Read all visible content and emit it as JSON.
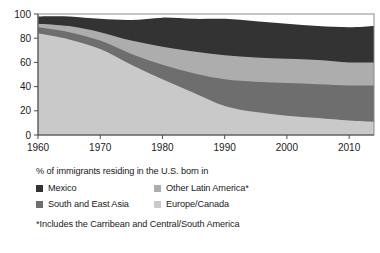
{
  "chart_data": {
    "type": "area",
    "stacked": true,
    "title": "",
    "subtitle": "",
    "xlabel": "",
    "ylabel": "",
    "xlim": [
      1960,
      2014
    ],
    "ylim": [
      0,
      100
    ],
    "grid": false,
    "legend_position": "below",
    "x_ticks": [
      "1960",
      "1970",
      "1980",
      "1990",
      "2000",
      "2010"
    ],
    "x_tick_values": [
      1960,
      1970,
      1980,
      1990,
      2000,
      2010
    ],
    "y_ticks": [
      "0",
      "20",
      "40",
      "60",
      "80",
      "100"
    ],
    "y_tick_values": [
      0,
      20,
      40,
      60,
      80,
      100
    ],
    "x": [
      1960,
      1965,
      1970,
      1975,
      1980,
      1985,
      1990,
      1995,
      2000,
      2005,
      2010,
      2014
    ],
    "series": [
      {
        "name": "Europe/Canada",
        "color": "#c9c9c9",
        "values": [
          84,
          79,
          71,
          58,
          46,
          35,
          24,
          19,
          16,
          14,
          12,
          11
        ]
      },
      {
        "name": "South and East Asia",
        "color": "#6e6e6e",
        "values": [
          5,
          6,
          7,
          9,
          12,
          16,
          22,
          25,
          27,
          28,
          29,
          30
        ]
      },
      {
        "name": "Other Latin America*",
        "color": "#adadad",
        "values": [
          3,
          5,
          7,
          11,
          15,
          18,
          20,
          20,
          20,
          20,
          19,
          19
        ]
      },
      {
        "name": "Mexico",
        "color": "#333333",
        "values": [
          6,
          8,
          11,
          17,
          24,
          27,
          30,
          30,
          29,
          28,
          29,
          30
        ]
      }
    ],
    "cumulative_tops": {
      "Europe/Canada": [
        84,
        79,
        71,
        58,
        46,
        35,
        24,
        19,
        16,
        14,
        12,
        11
      ],
      "South and East Asia": [
        89,
        85,
        78,
        67,
        58,
        51,
        46,
        44,
        43,
        42,
        41,
        41
      ],
      "Other Latin America*": [
        92,
        90,
        85,
        78,
        73,
        69,
        66,
        64,
        63,
        62,
        60,
        60
      ],
      "Mexico": [
        98,
        98,
        96,
        95,
        97,
        96,
        96,
        94,
        92,
        90,
        89,
        90
      ]
    }
  },
  "legend": {
    "title": "% of immigrants residing in the U.S. born in",
    "items": [
      {
        "label": "Mexico",
        "color": "#333333"
      },
      {
        "label": "Other Latin America*",
        "color": "#adadad"
      },
      {
        "label": "South and East Asia",
        "color": "#6e6e6e"
      },
      {
        "label": "Europe/Canada",
        "color": "#c9c9c9"
      }
    ],
    "footnote": "*Includes the Carribean and Central/South America"
  },
  "axis_style": {
    "axis_color": "#4d4d4d",
    "plot_border_color": "#8a8a8a"
  }
}
